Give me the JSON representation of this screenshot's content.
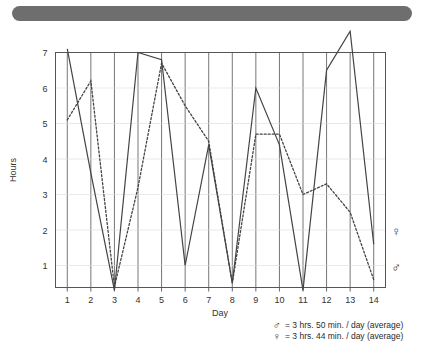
{
  "redaction": {
    "name": "redaction-bar",
    "color": "#6e6e6e"
  },
  "legend": {
    "rows": [
      {
        "symbol": "♂",
        "text": "= 3 hrs. 50 min. / day (average)"
      },
      {
        "symbol": "♀",
        "text": "= 3 hrs. 44 min. / day (average)"
      }
    ]
  },
  "end_markers": {
    "solid_series_symbol": "♀",
    "dotted_series_symbol": "♂"
  },
  "chart_data": {
    "type": "line",
    "title": "",
    "xlabel": "Day",
    "ylabel": "Hours",
    "x": [
      1,
      2,
      3,
      4,
      5,
      6,
      7,
      8,
      9,
      10,
      11,
      12,
      13,
      14
    ],
    "xtick_labels": [
      "1",
      "2",
      "3",
      "4",
      "5",
      "6",
      "7",
      "8",
      "9",
      "10",
      "11",
      "12",
      "13",
      "14"
    ],
    "ytick_labels": [
      "1",
      "2",
      "3",
      "4",
      "5",
      "6",
      "7"
    ],
    "xlim": [
      0.5,
      14.5
    ],
    "ylim": [
      0,
      7.8
    ],
    "grid": "vertical-lines-at-each-day",
    "legend_position": "below-right",
    "series": [
      {
        "name": "solid-line",
        "style": "solid",
        "color": "#444444",
        "end_symbol": "♀",
        "values": [
          7.1,
          3.6,
          0.3,
          7.0,
          6.8,
          1.0,
          4.4,
          0.5,
          6.0,
          4.4,
          0.3,
          6.5,
          7.6,
          1.6
        ]
      },
      {
        "name": "dotted-line",
        "style": "dotted",
        "color": "#444444",
        "end_symbol": "♂",
        "values": [
          5.1,
          6.2,
          0.4,
          3.2,
          6.7,
          5.5,
          4.5,
          0.5,
          4.7,
          4.7,
          3.0,
          3.3,
          2.5,
          0.6
        ]
      }
    ]
  }
}
